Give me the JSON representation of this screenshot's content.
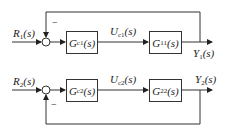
{
  "diagram": {
    "type": "block-diagram",
    "loops": [
      {
        "input": {
          "sym": "R",
          "sub": "1",
          "arg": "(s)"
        },
        "controller": {
          "sym": "G",
          "sub": "c1",
          "arg": "(s)"
        },
        "signal": {
          "sym": "U",
          "sub": "c1",
          "arg": "(s)"
        },
        "plant": {
          "sym": "G",
          "sub": "11",
          "arg": "(s)"
        },
        "output": {
          "sym": "Y",
          "sub": "1",
          "arg": "(s)"
        },
        "feedback_sign": "−",
        "feedback_position": "top"
      },
      {
        "input": {
          "sym": "R",
          "sub": "2",
          "arg": "(s)"
        },
        "controller": {
          "sym": "G",
          "sub": "c2",
          "arg": "(s)"
        },
        "signal": {
          "sym": "U",
          "sub": "c2",
          "arg": "(s)"
        },
        "plant": {
          "sym": "G",
          "sub": "22",
          "arg": "(s)"
        },
        "output": {
          "sym": "Y",
          "sub": "2",
          "arg": "(s)"
        },
        "feedback_sign": "−",
        "feedback_position": "bottom"
      }
    ]
  },
  "colors": {
    "line": "#333333",
    "text": "#222222",
    "background": "#ffffff"
  }
}
